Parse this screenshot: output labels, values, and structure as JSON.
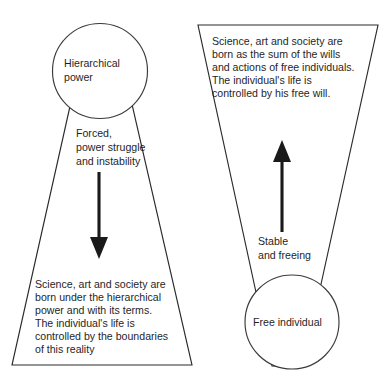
{
  "diagram": {
    "type": "conceptual-comparison-diagram",
    "background_color": "#ffffff",
    "stroke_color": "#2b2b2b",
    "text_color": "#1f1f1f",
    "left": {
      "shape": "funnel-narrow-top-wide-bottom",
      "node_label_line1": "Hierarchical",
      "node_label_line2": "power",
      "flow_label_line1": "Forced,",
      "flow_label_line2": "power struggle",
      "flow_label_line3": "and instability",
      "arrow_direction": "down",
      "body_line1": "Science, art and society are",
      "body_line2": "born under the hierarchical",
      "body_line3": "power and with its terms.",
      "body_line4": "The individual's life is",
      "body_line5": "controlled by the boundaries",
      "body_line6": "of this reality"
    },
    "right": {
      "shape": "funnel-wide-top-narrow-bottom",
      "node_label": "Free individual",
      "flow_label_line1": "Stable",
      "flow_label_line2": "and freeing",
      "arrow_direction": "up",
      "body_line1": "Science, art and society are",
      "body_line2": "born as the sum of the wills",
      "body_line3": "and actions of free individuals.",
      "body_line4": "The individual's life is",
      "body_line5": "controlled by his free will."
    }
  }
}
